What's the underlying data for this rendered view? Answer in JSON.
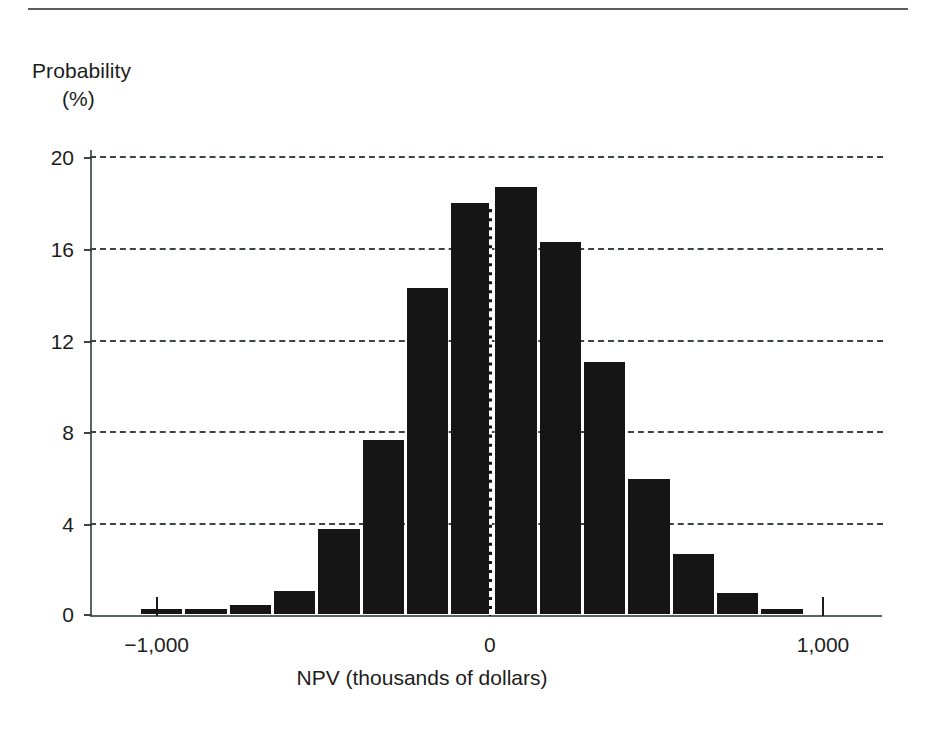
{
  "chart_data": {
    "type": "bar",
    "title": "",
    "subtitle": "",
    "xlabel": "NPV (thousands of dollars)",
    "ylabel": "Probability",
    "ylabel_unit": "(%)",
    "ylabel_full": "Probability (%)",
    "xlim": [
      -1200,
      1180
    ],
    "ylim": [
      0,
      20
    ],
    "grid": true,
    "grid_style": "dashed-horizontal",
    "legend": "none",
    "bar_color": "#151515",
    "axis_color": "#5a6363",
    "grid_color": "#3c4444",
    "bin_width": 133,
    "yticks": [
      0,
      4,
      8,
      12,
      16,
      20
    ],
    "ytick_labels": [
      "0",
      "4",
      "8",
      "12",
      "16",
      "20"
    ],
    "xticks": [
      -1000,
      0,
      1000
    ],
    "xtick_labels": [
      "−1,000",
      "0",
      "1,000"
    ],
    "annotations": [
      {
        "name": "zero-reference-line",
        "x": 0,
        "style": "dashed-vertical"
      }
    ],
    "x": [
      -985,
      -852,
      -719,
      -586,
      -453,
      -320,
      -187,
      -54,
      79,
      212,
      345,
      478,
      611,
      744,
      877
    ],
    "categories": [
      "-985",
      "-852",
      "-719",
      "-586",
      "-453",
      "-320",
      "-187",
      "-54",
      "79",
      "212",
      "345",
      "478",
      "611",
      "744",
      "877"
    ],
    "values": [
      0.2,
      0.2,
      0.4,
      1.0,
      3.7,
      7.6,
      14.2,
      17.9,
      18.6,
      16.2,
      11.0,
      5.9,
      2.6,
      0.9,
      0.2
    ]
  },
  "figure": {
    "top_rule": true
  }
}
